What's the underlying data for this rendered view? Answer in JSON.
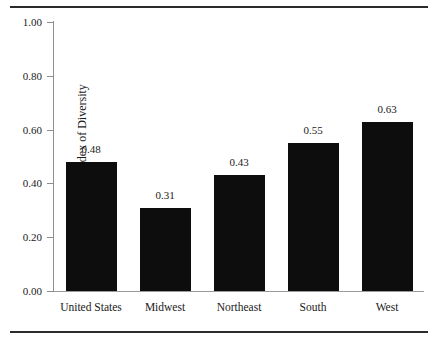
{
  "chart_data": {
    "type": "bar",
    "title": "",
    "subtitle": "",
    "xlabel": "",
    "ylabel": "Racial Index of Diversity",
    "categories": [
      "United States",
      "Midwest",
      "Northeast",
      "South",
      "West"
    ],
    "values": [
      0.48,
      0.31,
      0.43,
      0.55,
      0.63
    ],
    "value_labels": [
      "0.48",
      "0.31",
      "0.43",
      "0.55",
      "0.63"
    ],
    "ylim": [
      0.0,
      1.0
    ],
    "ytick_values": [
      0.0,
      0.2,
      0.4,
      0.6,
      0.8,
      1.0
    ],
    "ytick_labels": [
      "0.00",
      "0.20",
      "0.40",
      "0.60",
      "0.80",
      "1.00"
    ],
    "grid": false,
    "legend": null,
    "legend_position": "none",
    "bar_color": "#0d0d0d",
    "axis_color": "#8d8d8d",
    "text_color": "#1a1a1a",
    "background_color": "#ffffff",
    "annotations": []
  },
  "figure": {
    "top_rule": "",
    "bottom_rule": ""
  }
}
